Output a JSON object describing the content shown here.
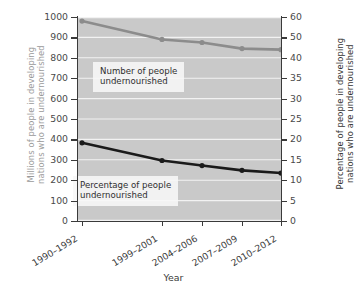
{
  "axes": {
    "left_title_lines": [
      "Millions of people in developing",
      "nations who are undernourished"
    ],
    "right_title_lines": [
      "Percentage of people in developing",
      "nations who are undernourished"
    ],
    "x_title": "Year",
    "left_ticks": [
      "1000",
      "900",
      "800",
      "700",
      "600",
      "500",
      "400",
      "300",
      "200",
      "100",
      "0"
    ],
    "right_ticks": [
      "60",
      "50",
      "40",
      "35",
      "30",
      "25",
      "20",
      "15",
      "10",
      "5",
      "0"
    ],
    "x_ticks": [
      "1990–1992",
      "1999–2001",
      "2004–2006",
      "2007–2009",
      "2010–2012"
    ]
  },
  "annotations": {
    "number_lines": [
      "Number of people",
      "undernourished"
    ],
    "percent_lines": [
      "Percentage of people",
      "undernourished"
    ]
  },
  "colors": {
    "plot_background": "#c9c9c9",
    "gridline": "#f2f2f2",
    "number_series": "#8c8c8c",
    "percent_series": "#1a1a1a",
    "axis": "#3a3a3a",
    "left_title": "#9a9a9a"
  },
  "chart_data": {
    "type": "line",
    "title": "",
    "xlabel": "Year",
    "categories": [
      "1990–1992",
      "1999–2001",
      "2004–2006",
      "2007–2009",
      "2010–2012"
    ],
    "grid": "horizontal",
    "legend": "in-plot annotations",
    "series": [
      {
        "name": "Number of people undernourished",
        "axis": "left",
        "ylabel": "Millions of people in developing nations who are undernourished",
        "ylim": [
          0,
          1000
        ],
        "color": "#8c8c8c",
        "x": [
          "1990–1992",
          "1999–2001",
          "2004–2006",
          "2007–2009",
          "2010–2012"
        ],
        "values": [
          980,
          890,
          875,
          845,
          840
        ]
      },
      {
        "name": "Percentage of people undernourished",
        "axis": "right",
        "ylabel": "Percentage of people in developing nations who are undernourished",
        "ylim": [
          0,
          60
        ],
        "color": "#1a1a1a",
        "x": [
          "1990–1992",
          "1999–2001",
          "2004–2006",
          "2007–2009",
          "2010–2012"
        ],
        "values": [
          23.0,
          17.8,
          16.3,
          14.9,
          14.1
        ]
      }
    ]
  }
}
